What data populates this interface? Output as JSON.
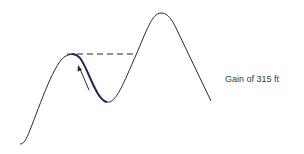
{
  "diagram": {
    "label": "Gain of 315 ft",
    "colors": {
      "curve": "#2a2a2a",
      "highlight": "#1c2a5c",
      "dashed": "#2a2a2a",
      "text": "#3a3a3a"
    }
  }
}
